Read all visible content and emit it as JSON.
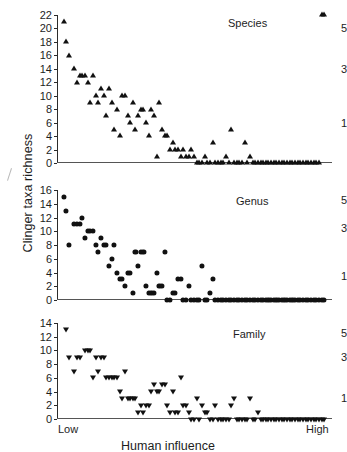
{
  "figure": {
    "y_axis_title": "Clinger taxa richness",
    "x_axis_title": "Human influence",
    "x_low_label": "Low",
    "x_high_label": "High",
    "marker_color": "#111111",
    "axis_color": "#2b2b2b"
  },
  "chart_data": [
    {
      "type": "scatter",
      "title": "Species",
      "xlabel": "Human influence",
      "ylabel": "Clinger taxa richness",
      "ylim": [
        0,
        22
      ],
      "yticks": [
        0,
        2,
        4,
        6,
        8,
        10,
        12,
        14,
        16,
        18,
        20,
        22
      ],
      "xlim": [
        0,
        100
      ],
      "xticks": [],
      "xtick_labels": [
        "Low",
        "High"
      ],
      "grid": false,
      "marker": "triangle-up",
      "right_axis_labels": [
        "5",
        "3",
        "1"
      ],
      "right_axis_values": [
        20,
        14,
        6
      ],
      "x": [
        1,
        2,
        3,
        5,
        6,
        7,
        8,
        9,
        10,
        11,
        12,
        13,
        14,
        15,
        16,
        17,
        18,
        19,
        20,
        21,
        22,
        23,
        24,
        25,
        26,
        27,
        28,
        29,
        30,
        31,
        32,
        33,
        34,
        35,
        36,
        37,
        38,
        39,
        40,
        41,
        42,
        43,
        44,
        45,
        46,
        47,
        48,
        49,
        50,
        51,
        52,
        53,
        54,
        55,
        56,
        57,
        58,
        59,
        60,
        61,
        62,
        63,
        64,
        65,
        66,
        67,
        68,
        69,
        70,
        71,
        72,
        73,
        74,
        75,
        76,
        77,
        78,
        79,
        80,
        81,
        82,
        83,
        84,
        85,
        86,
        87,
        88,
        89,
        90,
        91,
        92,
        93,
        94,
        95,
        96,
        97,
        98,
        99
      ],
      "y": [
        21,
        18,
        16,
        14,
        12,
        13,
        13,
        13,
        12,
        9,
        13,
        10,
        9,
        11,
        10,
        7,
        11,
        9,
        5,
        8,
        4,
        10,
        10,
        7,
        6,
        9,
        5,
        7,
        8,
        8,
        6,
        4,
        8,
        7,
        1,
        9,
        5,
        4,
        4,
        2,
        3,
        2,
        2,
        1,
        2,
        1,
        1,
        2,
        1,
        0,
        0,
        0,
        1,
        0,
        0,
        3,
        0,
        0,
        0,
        0,
        1,
        0,
        5,
        0,
        0,
        0,
        0,
        3,
        0,
        1,
        0,
        0,
        0,
        0,
        0,
        0,
        0,
        0,
        0,
        0,
        0,
        0,
        0,
        0,
        0,
        0,
        0,
        0,
        0,
        0,
        0,
        0,
        0,
        0,
        0,
        0
      ]
    },
    {
      "type": "scatter",
      "title": "Genus",
      "xlabel": "Human influence",
      "ylabel": "Clinger taxa richness",
      "ylim": [
        0,
        16
      ],
      "yticks": [
        0,
        2,
        4,
        6,
        8,
        10,
        12,
        14,
        16
      ],
      "xlim": [
        0,
        100
      ],
      "xticks": [],
      "xtick_labels": [
        "Low",
        "High"
      ],
      "grid": false,
      "marker": "circle",
      "right_axis_labels": [
        "5",
        "3",
        "1"
      ],
      "right_axis_values": [
        14.5,
        10.5,
        3.5
      ],
      "x": [
        1,
        2,
        3,
        5,
        6,
        7,
        8,
        9,
        10,
        11,
        12,
        13,
        14,
        15,
        16,
        17,
        18,
        19,
        20,
        21,
        22,
        23,
        24,
        25,
        26,
        27,
        28,
        29,
        30,
        31,
        32,
        33,
        34,
        35,
        36,
        37,
        38,
        39,
        40,
        41,
        42,
        43,
        44,
        45,
        46,
        47,
        48,
        49,
        50,
        51,
        52,
        53,
        54,
        55,
        56,
        57,
        58,
        59,
        60,
        61,
        62,
        63,
        64,
        65,
        66,
        67,
        68,
        69,
        70,
        71,
        72,
        73,
        74,
        75,
        76,
        77,
        78,
        79,
        80,
        81,
        82,
        83,
        84,
        85,
        86,
        87,
        88,
        89,
        90,
        91,
        92,
        93,
        94,
        95,
        96,
        97,
        98,
        99
      ],
      "y": [
        15,
        13,
        8,
        11,
        11,
        11,
        12,
        9,
        10,
        10,
        10,
        8,
        7,
        9,
        8,
        8,
        5,
        6,
        8,
        4,
        3,
        3,
        2,
        4,
        4,
        1,
        7,
        5,
        7,
        7,
        2,
        1,
        1,
        1,
        4,
        2,
        2,
        7,
        0,
        0,
        1,
        1,
        3,
        3,
        0,
        0,
        2,
        0,
        0,
        0,
        0,
        5,
        0,
        0,
        1,
        3,
        0,
        0,
        0,
        0,
        0,
        0,
        0,
        0,
        0,
        0,
        0,
        0,
        0,
        0,
        0,
        0,
        0,
        0,
        0,
        0,
        0,
        0,
        0,
        0,
        0,
        0,
        0,
        0,
        0,
        0,
        0,
        0,
        0,
        0,
        0,
        0,
        0,
        0,
        0,
        0,
        0,
        0
      ]
    },
    {
      "type": "scatter",
      "title": "Family",
      "xlabel": "Human influence",
      "ylabel": "Clinger taxa richness",
      "ylim": [
        0,
        14
      ],
      "yticks": [
        0,
        2,
        4,
        6,
        8,
        10,
        12,
        14
      ],
      "xlim": [
        0,
        100
      ],
      "xticks": [],
      "xtick_labels": [
        "Low",
        "High"
      ],
      "grid": false,
      "marker": "triangle-down",
      "right_axis_labels": [
        "5",
        "3",
        "1"
      ],
      "right_axis_values": [
        12.5,
        9,
        3
      ],
      "x": [
        2,
        3,
        5,
        6,
        7,
        9,
        10,
        11,
        12,
        13,
        14,
        15,
        16,
        17,
        18,
        19,
        20,
        21,
        22,
        23,
        24,
        25,
        26,
        27,
        28,
        29,
        30,
        31,
        32,
        33,
        34,
        35,
        36,
        37,
        38,
        39,
        40,
        41,
        42,
        43,
        44,
        45,
        46,
        47,
        48,
        49,
        50,
        51,
        52,
        53,
        54,
        55,
        56,
        57,
        58,
        59,
        60,
        61,
        62,
        63,
        64,
        65,
        66,
        67,
        68,
        69,
        70,
        71,
        72,
        73,
        74,
        75,
        76,
        77,
        78,
        79,
        80,
        81,
        82,
        83,
        84,
        85,
        86,
        87,
        88,
        89,
        90,
        91,
        92,
        93,
        94,
        95,
        96,
        97,
        98,
        99
      ],
      "y": [
        13,
        9,
        7,
        9,
        9,
        10,
        10,
        10,
        6,
        9,
        7,
        9,
        9,
        6,
        6,
        6,
        6,
        6,
        4,
        3,
        7,
        3,
        3,
        3,
        3,
        1,
        2,
        1,
        2,
        2,
        4,
        5,
        4,
        4,
        5,
        5,
        2,
        1,
        4,
        1,
        1,
        6,
        2,
        2,
        1,
        0,
        0,
        3,
        0,
        2,
        1,
        1,
        0,
        0,
        2,
        0,
        0,
        0,
        0,
        0,
        2,
        3,
        0,
        0,
        0,
        0,
        0,
        3,
        0,
        0,
        1,
        0,
        0,
        0,
        0,
        0,
        0,
        0,
        0,
        0,
        0,
        0,
        0,
        0,
        0,
        0,
        0,
        0,
        0,
        0,
        0,
        0,
        0,
        0,
        0,
        0
      ]
    }
  ]
}
